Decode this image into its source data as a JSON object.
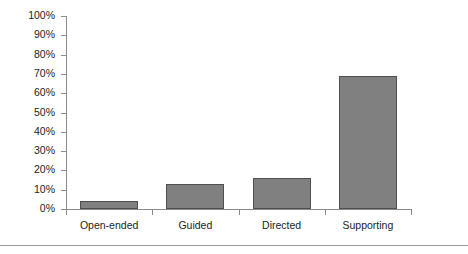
{
  "chart_data": {
    "type": "bar",
    "title": "",
    "subtitle": "",
    "xlabel": "",
    "ylabel": "",
    "categories": [
      "Open-ended",
      "Guided",
      "Directed",
      "Supporting"
    ],
    "values": [
      4,
      13,
      16,
      69
    ],
    "series": [
      {
        "name": "Percentage",
        "values": [
          4,
          13,
          16,
          69
        ]
      }
    ],
    "ylim": [
      0,
      100
    ],
    "ytick_labels": [
      "100%",
      "90%",
      "80%",
      "70%",
      "60%",
      "50%",
      "40%",
      "30%",
      "20%",
      "10%",
      "0%"
    ],
    "ytick_values": [
      100,
      90,
      80,
      70,
      60,
      50,
      40,
      30,
      20,
      10,
      0
    ],
    "grid": false,
    "legend": null,
    "legend_position": "none",
    "annotations": [],
    "colors": {
      "bar_fill": "#808080",
      "bar_border": "#4f4f4f",
      "axis": "#8a8a8a",
      "text": "#1d1d1d",
      "background": "#ffffff",
      "rule": "#9a9a9a"
    }
  }
}
